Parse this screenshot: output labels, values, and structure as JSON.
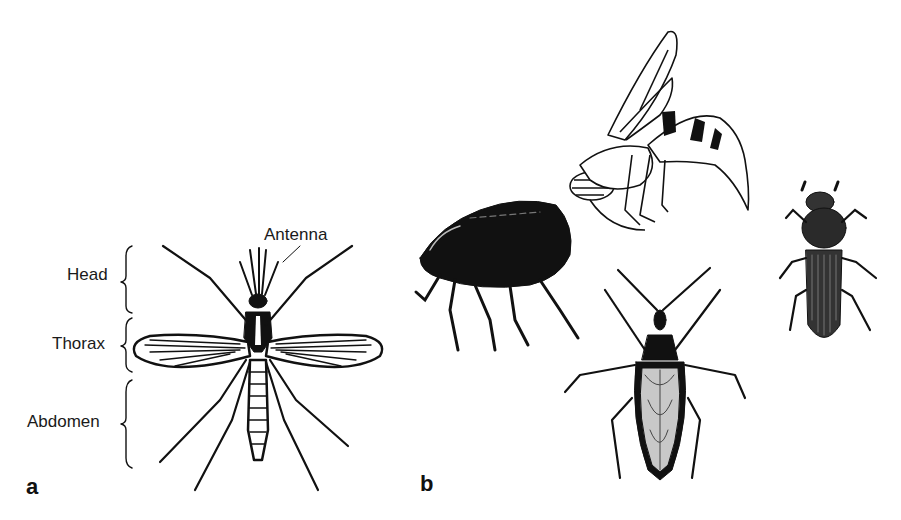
{
  "figure": {
    "panel_a": {
      "letter": "a",
      "subject": "mosquito",
      "labels": {
        "head": "Head",
        "thorax": "Thorax",
        "abdomen": "Abdomen",
        "antenna": "Antenna"
      }
    },
    "panel_b": {
      "letter": "b",
      "subjects": [
        "flea",
        "wasp",
        "assassin-bug",
        "beetle"
      ]
    }
  },
  "colors": {
    "ink": "#111111",
    "background": "#ffffff"
  }
}
